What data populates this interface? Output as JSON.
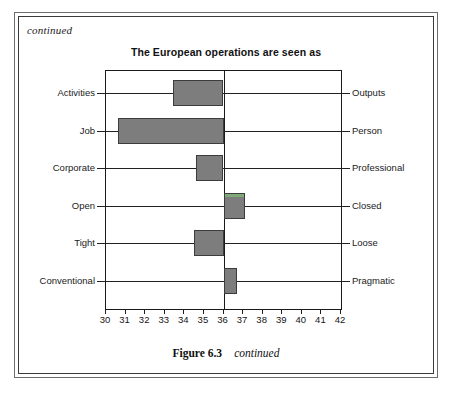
{
  "page": {
    "continued_note": "continued"
  },
  "caption": {
    "number": "Figure 6.3",
    "continued": "continued"
  },
  "colors": {
    "bar_fill": "#7d7d7d",
    "bar_stroke": "#3c3c3c",
    "green_cap": "#7fa977",
    "axis": "#1a1a1a",
    "text": "#1b1b1b"
  },
  "chart_data": {
    "type": "bar",
    "orientation": "horizontal",
    "title": "The European operations are seen as",
    "xlabel": "",
    "ylabel": "",
    "xlim": [
      30,
      42
    ],
    "baseline": 36,
    "grid": false,
    "legend": null,
    "xticks": [
      30,
      31,
      32,
      33,
      34,
      35,
      36,
      37,
      38,
      39,
      40,
      41,
      42
    ],
    "xtick_labels": [
      "30",
      "31",
      "32",
      "33",
      "34",
      "35",
      "36",
      "37",
      "38",
      "39",
      "40",
      "41",
      "42"
    ],
    "categories": [
      "Activities",
      "Job",
      "Corporate",
      "Open",
      "Tight",
      "Conventional"
    ],
    "categories_right": [
      "Outputs",
      "Person",
      "Professional",
      "Closed",
      "Loose",
      "Pragmatic"
    ],
    "values": [
      33.4,
      30.6,
      34.6,
      37.1,
      34.5,
      36.7
    ],
    "bars": [
      {
        "left_label": "Activities",
        "right_label": "Outputs",
        "value": 33.4,
        "direction": "left",
        "green_cap": false
      },
      {
        "left_label": "Job",
        "right_label": "Person",
        "value": 30.6,
        "direction": "left",
        "green_cap": false
      },
      {
        "left_label": "Corporate",
        "right_label": "Professional",
        "value": 34.6,
        "direction": "left",
        "green_cap": false
      },
      {
        "left_label": "Open",
        "right_label": "Closed",
        "value": 37.1,
        "direction": "right",
        "green_cap": true
      },
      {
        "left_label": "Tight",
        "right_label": "Loose",
        "value": 34.5,
        "direction": "left",
        "green_cap": false
      },
      {
        "left_label": "Conventional",
        "right_label": "Pragmatic",
        "value": 36.7,
        "direction": "right",
        "green_cap": false
      }
    ]
  }
}
